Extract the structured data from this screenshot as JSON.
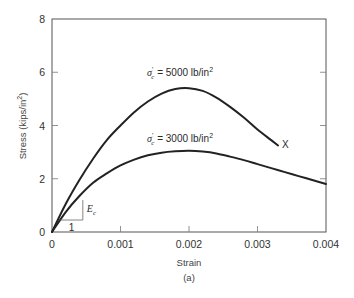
{
  "chart_data": {
    "type": "line",
    "title": "",
    "caption": "(a)",
    "xlabel": "Strain",
    "ylabel": "Stress (kips/in",
    "ylabel_sup": "2",
    "ylabel_close": ")",
    "xlim": [
      0,
      0.004
    ],
    "ylim": [
      0,
      8
    ],
    "grid": false,
    "legend": "none (inline curve annotations)",
    "x_ticks": [
      0,
      0.001,
      0.002,
      0.003,
      0.004
    ],
    "x_tick_labels": [
      "0",
      "0.001",
      "0.002",
      "0.003",
      "0.004"
    ],
    "y_ticks": [
      0,
      2,
      4,
      6,
      8
    ],
    "y_tick_labels": [
      "0",
      "2",
      "4",
      "6",
      "8"
    ],
    "series": [
      {
        "name": "σ'c = 5000 lb/in²",
        "label_prefix": "σ",
        "label_sub": "c",
        "label_text": " = 5000 lb/in",
        "label_sup": "2",
        "x": [
          0,
          0.0002,
          0.0004,
          0.0006,
          0.0008,
          0.001,
          0.0012,
          0.0014,
          0.0016,
          0.0018,
          0.002,
          0.0022,
          0.0024,
          0.0026,
          0.0028,
          0.003,
          0.0032,
          0.0033
        ],
        "y": [
          0,
          1.05,
          1.95,
          2.75,
          3.45,
          4.0,
          4.5,
          4.9,
          5.2,
          5.37,
          5.4,
          5.3,
          5.05,
          4.7,
          4.3,
          3.85,
          3.45,
          3.25
        ],
        "end_marker": "X",
        "end_marker_at": [
          0.0033,
          3.25
        ]
      },
      {
        "name": "σ'c = 3000 lb/in²",
        "label_prefix": "σ",
        "label_sub": "c",
        "label_text": " = 3000 lb/in",
        "label_sup": "2",
        "x": [
          0,
          0.0002,
          0.0004,
          0.0006,
          0.0008,
          0.001,
          0.0012,
          0.0014,
          0.0016,
          0.0018,
          0.002,
          0.0022,
          0.0024,
          0.0026,
          0.0028,
          0.003,
          0.0032,
          0.0034,
          0.0036,
          0.0038,
          0.004
        ],
        "y": [
          0,
          0.75,
          1.35,
          1.85,
          2.2,
          2.5,
          2.72,
          2.88,
          2.98,
          3.03,
          3.05,
          3.02,
          2.95,
          2.83,
          2.7,
          2.55,
          2.4,
          2.25,
          2.1,
          1.95,
          1.8
        ]
      }
    ],
    "annotations": [
      {
        "type": "slope-triangle",
        "label": "E",
        "label_sub": "c",
        "run_label": "1",
        "x0": 0.00012,
        "y0": 0.45,
        "x1": 0.00045,
        "y1": 1.2
      }
    ]
  }
}
